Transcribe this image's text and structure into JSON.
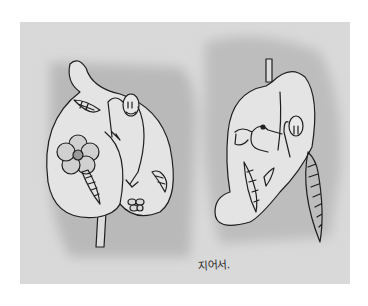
{
  "artwork": {
    "type": "ink illustration with gray wash",
    "signature": "지어서.",
    "colors": {
      "page_background": "#ffffff",
      "paper": "#d9d9d9",
      "wash_dark": "#b8b8b8",
      "leaf_fill": "#e6e6e6",
      "ink": "#1e1e1e"
    },
    "panels": [
      {
        "id": "left-leaf",
        "description": "Large heart-shaped leaf with a figure peeking around its fold, a five-petal flower, small leaves and a small flower/bug",
        "elements": [
          "leaf",
          "stem",
          "figure-face",
          "flower",
          "small-leaf",
          "small-leaf",
          "small-leaf",
          "bug"
        ]
      },
      {
        "id": "right-leaf",
        "description": "Folded leaf with a frog, a figure hiding behind the fold, and hanging serrated leaves",
        "elements": [
          "leaf",
          "stem",
          "frog",
          "figure-face",
          "small-leaf",
          "small-leaf",
          "hanging-leaf"
        ]
      }
    ]
  }
}
